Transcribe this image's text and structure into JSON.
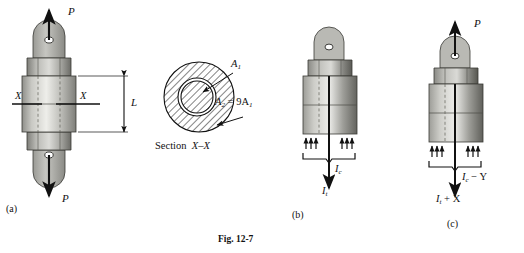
{
  "figure": {
    "caption": "Fig. 12-7",
    "panels": [
      {
        "id": "a",
        "label": "(a)",
        "force_top": "P",
        "force_bottom": "P",
        "section_left": "X",
        "section_right": "X",
        "length_label": "L"
      },
      {
        "id": "b",
        "label": "(b)",
        "force_compression": "I",
        "force_compression_sub": "c",
        "force_tension": "I",
        "force_tension_sub": "t"
      },
      {
        "id": "c",
        "label": "(c)",
        "force_top": "P",
        "force_compression": "I",
        "force_compression_sub": "c",
        "force_compression_term": " − Y",
        "force_tension": "I",
        "force_tension_sub": "t",
        "force_tension_term": " + X"
      }
    ],
    "section_view": {
      "title_word": "Section",
      "title_name": "X–X",
      "inner_area": "A",
      "inner_area_sub": "1",
      "outer_area": "A",
      "outer_area_sub": "2",
      "relation": " = 9A",
      "relation_sub": "1"
    }
  },
  "colors": {
    "ink": "#111111",
    "metal_light": "#d8d8d4",
    "metal_mid": "#b3b3ae",
    "metal_dark": "#8d8d88",
    "metal_darker": "#6e6e69",
    "hatch": "#222222"
  }
}
